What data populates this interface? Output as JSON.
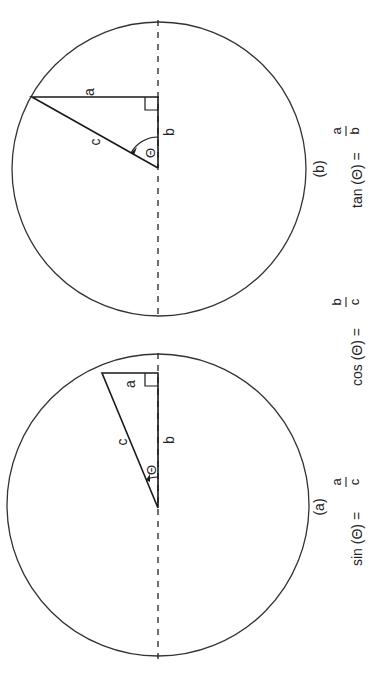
{
  "figure": {
    "orientation": "rotated-90-ccw",
    "colors": {
      "stroke": "#222222",
      "background": "#ffffff"
    },
    "panels": [
      {
        "id": "a",
        "caption": "(a)",
        "labels": {
          "opposite": "a",
          "adjacent": "b",
          "hypotenuse": "c",
          "angle": "Θ"
        },
        "circle": {
          "cx": 158,
          "cy": 505,
          "r": 150
        },
        "triangle": {
          "center": [
            158,
            508
          ],
          "corner": [
            158,
            373
          ],
          "apex": [
            102,
            373
          ]
        }
      },
      {
        "id": "b",
        "caption": "(b)",
        "labels": {
          "opposite": "a",
          "adjacent": "b",
          "hypotenuse": "c",
          "angle": "Θ"
        },
        "circle": {
          "cx": 159,
          "cy": 169,
          "r": 147
        },
        "triangle": {
          "center": [
            158,
            168
          ],
          "corner": [
            158,
            97
          ],
          "apex": [
            32,
            97
          ]
        }
      }
    ],
    "formulas": {
      "sin": {
        "lhs": "sin (Θ) =",
        "num": "a",
        "den": "c"
      },
      "cos": {
        "lhs": "cos (Θ) =",
        "num": "b",
        "den": "c"
      },
      "tan": {
        "lhs": "tan (Θ) =",
        "num": "a",
        "den": "b"
      }
    }
  }
}
